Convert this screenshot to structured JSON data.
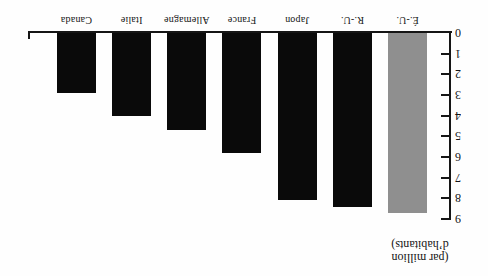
{
  "chart_data": {
    "type": "bar",
    "title": "",
    "categories": [
      "É.-U.",
      "R.-U.",
      "Japon",
      "France",
      "Allemagne",
      "Italie",
      "Canada"
    ],
    "values": [
      8.7,
      8.4,
      8.1,
      5.8,
      4.7,
      4.0,
      2.9
    ],
    "bar_colors": [
      "#8f8f8f",
      "#0a0a0a",
      "#0a0a0a",
      "#0a0a0a",
      "#0a0a0a",
      "#0a0a0a",
      "#0a0a0a"
    ],
    "ylabel_lines": [
      "(par million",
      "d’habitants)"
    ],
    "y_ticks": [
      0,
      1,
      2,
      3,
      4,
      5,
      6,
      7,
      8,
      9
    ],
    "ylim": [
      0,
      9
    ],
    "grid": false,
    "legend": "none",
    "axis_color": "#151515",
    "rendered_rotated_180": true
  }
}
